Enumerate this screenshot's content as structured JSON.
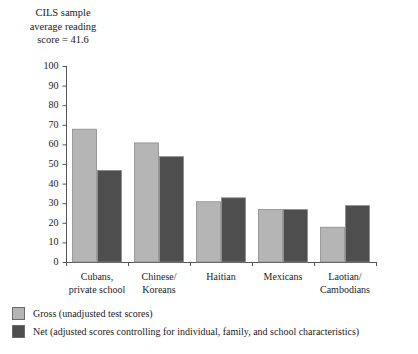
{
  "chart_data": {
    "type": "bar",
    "title": "CILS sample average reading score = 41.6",
    "title_lines": [
      "CILS sample",
      "average reading",
      "score = 41.6"
    ],
    "xlabel": "",
    "ylabel": "",
    "ylim": [
      0,
      100
    ],
    "yticks": [
      0,
      10,
      20,
      30,
      40,
      50,
      60,
      70,
      80,
      90,
      100
    ],
    "ytick_labels": [
      "0",
      "10",
      "20",
      "30",
      "40",
      "50",
      "60",
      "70",
      "80",
      "90",
      "100"
    ],
    "grid": false,
    "legend_position": "below-left",
    "categories": [
      "Cubans, private school",
      "Chinese/ Koreans",
      "Haitian",
      "Mexicans",
      "Laotian/ Cambodians"
    ],
    "category_lines": [
      [
        "Cubans,",
        "private school"
      ],
      [
        "Chinese/",
        "Koreans"
      ],
      [
        "Haitian"
      ],
      [
        "Mexicans"
      ],
      [
        "Laotian/",
        "Cambodians"
      ]
    ],
    "series": [
      {
        "name": "Gross (unadjusted test scores)",
        "color": "#b5b5b5",
        "values": [
          68,
          61,
          31,
          27,
          18
        ]
      },
      {
        "name": "Net (adjusted scores controlling for individual, family, and school characteristics)",
        "color": "#4e4e4e",
        "values": [
          47,
          54,
          33,
          27,
          29
        ]
      }
    ]
  },
  "legend": {
    "items": [
      {
        "label": "Gross (unadjusted test scores)",
        "color": "#b5b5b5"
      },
      {
        "label": "Net (adjusted scores controlling for individual, family, and school characteristics)",
        "color": "#4e4e4e"
      }
    ]
  },
  "colors": {
    "gross": "#b5b5b5",
    "net": "#4e4e4e",
    "axis": "#555555",
    "text": "#1a1a1a",
    "background": "#ffffff"
  }
}
